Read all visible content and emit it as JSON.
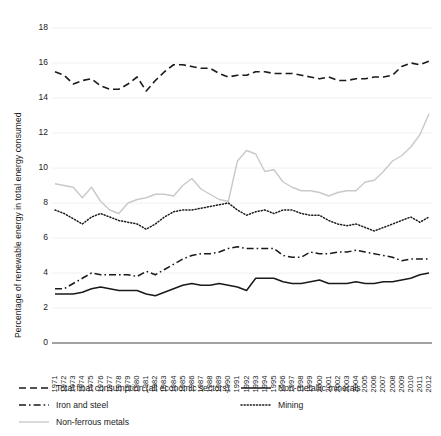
{
  "chart_data": {
    "type": "line",
    "title": "",
    "xlabel": "",
    "ylabel": "Percentage of renewable energy in total energy consumed",
    "ylim": [
      0,
      18
    ],
    "yticks": [
      0,
      2,
      4,
      6,
      8,
      10,
      12,
      14,
      16,
      18
    ],
    "grid": true,
    "grid_axis": "y",
    "legend_position": "below-axes",
    "x": [
      1971,
      1972,
      1973,
      1974,
      1975,
      1976,
      1977,
      1978,
      1979,
      1980,
      1981,
      1982,
      1983,
      1984,
      1985,
      1986,
      1987,
      1988,
      1989,
      1990,
      1991,
      1992,
      1993,
      1994,
      1995,
      1996,
      1997,
      1998,
      1999,
      2000,
      2001,
      2002,
      2003,
      2004,
      2005,
      2006,
      2007,
      2008,
      2009,
      2010,
      2011,
      2012
    ],
    "categories": [
      "1971",
      "1972",
      "1973",
      "1974",
      "1975",
      "1976",
      "1977",
      "1978",
      "1979",
      "1980",
      "1981",
      "1982",
      "1983",
      "1984",
      "1985",
      "1986",
      "1987",
      "1988",
      "1989",
      "1990",
      "1991",
      "1992",
      "1993",
      "1994",
      "1995",
      "1996",
      "1997",
      "1998",
      "1999",
      "2000",
      "2001",
      "2002",
      "2003",
      "2004",
      "2005",
      "2006",
      "2007",
      "2008",
      "2009",
      "2010",
      "2011",
      "2012"
    ],
    "series": [
      {
        "name": "Total final consumption (all economic sectors)",
        "style": "dashed",
        "color": "#1a1a1a",
        "values": [
          15.5,
          15.3,
          14.8,
          15.0,
          15.1,
          14.7,
          14.5,
          14.5,
          14.8,
          15.2,
          14.4,
          15.0,
          15.5,
          15.9,
          15.9,
          15.8,
          15.7,
          15.7,
          15.4,
          15.2,
          15.3,
          15.3,
          15.5,
          15.5,
          15.4,
          15.4,
          15.4,
          15.3,
          15.2,
          15.1,
          15.2,
          15.0,
          15.0,
          15.1,
          15.1,
          15.2,
          15.2,
          15.3,
          15.8,
          16.0,
          15.9,
          16.1
        ]
      },
      {
        "name": "Iron and steel",
        "style": "dashdot",
        "color": "#1a1a1a",
        "values": [
          3.1,
          3.1,
          3.4,
          3.7,
          4.0,
          3.9,
          3.9,
          3.9,
          3.9,
          3.8,
          4.1,
          3.9,
          4.2,
          4.5,
          4.8,
          5.0,
          5.1,
          5.1,
          5.2,
          5.4,
          5.5,
          5.4,
          5.4,
          5.4,
          5.4,
          5.0,
          4.9,
          4.9,
          5.2,
          5.1,
          5.1,
          5.2,
          5.2,
          5.3,
          5.2,
          5.1,
          5.0,
          4.9,
          4.7,
          4.8,
          4.8,
          4.8
        ]
      },
      {
        "name": "Non-ferrous metals",
        "style": "solid-light",
        "color": "#c9c9c9",
        "values": [
          9.1,
          9.0,
          8.9,
          8.3,
          8.9,
          8.1,
          7.6,
          7.4,
          8.0,
          8.2,
          8.3,
          8.5,
          8.5,
          8.4,
          9.0,
          9.4,
          8.8,
          8.5,
          8.2,
          8.1,
          10.4,
          11.0,
          10.8,
          9.8,
          9.9,
          9.2,
          8.9,
          8.7,
          8.7,
          8.6,
          8.4,
          8.6,
          8.7,
          8.7,
          9.2,
          9.3,
          9.8,
          10.4,
          10.7,
          11.2,
          11.9,
          13.1
        ]
      },
      {
        "name": "Non-metallic minerals",
        "style": "solid",
        "color": "#1a1a1a",
        "values": [
          2.8,
          2.8,
          2.8,
          2.9,
          3.1,
          3.2,
          3.1,
          3.0,
          3.0,
          3.0,
          2.8,
          2.7,
          2.9,
          3.1,
          3.3,
          3.4,
          3.3,
          3.3,
          3.4,
          3.3,
          3.2,
          3.0,
          3.7,
          3.7,
          3.7,
          3.5,
          3.4,
          3.4,
          3.5,
          3.6,
          3.4,
          3.4,
          3.4,
          3.5,
          3.4,
          3.4,
          3.5,
          3.5,
          3.6,
          3.7,
          3.9,
          4.0
        ]
      },
      {
        "name": "Mining",
        "style": "dotted",
        "color": "#1a1a1a",
        "values": [
          7.6,
          7.4,
          7.1,
          6.8,
          7.2,
          7.4,
          7.2,
          7.0,
          6.9,
          6.8,
          6.5,
          6.8,
          7.2,
          7.5,
          7.6,
          7.6,
          7.7,
          7.8,
          7.9,
          8.0,
          7.6,
          7.3,
          7.5,
          7.6,
          7.4,
          7.6,
          7.6,
          7.4,
          7.3,
          7.3,
          7.0,
          6.8,
          6.7,
          6.8,
          6.6,
          6.4,
          6.6,
          6.8,
          7.0,
          7.2,
          6.9,
          7.2
        ]
      }
    ]
  },
  "legend": {
    "entries": [
      {
        "label": "Total final consumption (all economic sectors)",
        "style": "dashed"
      },
      {
        "label": "Iron and steel",
        "style": "dashdot"
      },
      {
        "label": "Non-ferrous metals",
        "style": "solid-light"
      },
      {
        "label": "Non-metallic minerals",
        "style": "solid"
      },
      {
        "label": "Mining",
        "style": "dotted"
      }
    ]
  },
  "colors": {
    "ink": "#1a1a1a",
    "light_line": "#c9c9c9",
    "grid": "#f0f0f0",
    "axis": "#444444",
    "background": "#ffffff"
  }
}
